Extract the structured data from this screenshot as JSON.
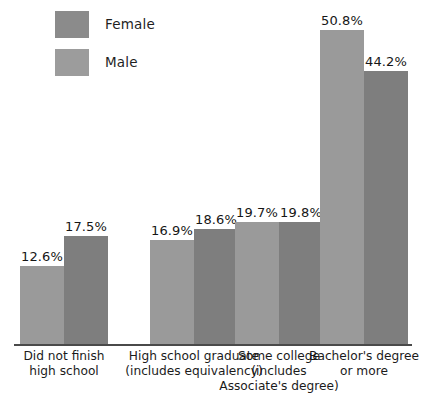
{
  "chart_data": {
    "type": "bar",
    "title": "",
    "subtitle": "",
    "xlabel": "",
    "ylabel": "",
    "ylim": [
      0,
      55
    ],
    "grid": false,
    "legend_position": "top-left",
    "orientation": "vertical",
    "value_suffix": "%",
    "categories": [
      "Did not finish high school",
      "High school graduate (includes equivalency)",
      "Some college (includes Associate's degree)",
      "Bachelor's degree or more"
    ],
    "category_lines": [
      [
        "Did not finish",
        "high school"
      ],
      [
        "High school graduate",
        "(includes equivalency)"
      ],
      [
        "Some college",
        "(includes",
        "Associate's degree)"
      ],
      [
        "Bachelor's degree",
        "or more"
      ]
    ],
    "series": [
      {
        "name": "Female",
        "color": "#9a9a9a",
        "values": [
          12.6,
          16.9,
          19.7,
          50.8
        ],
        "labels": [
          "12.6%",
          "16.9%",
          "19.7%",
          "50.8%"
        ]
      },
      {
        "name": "Male",
        "color": "#7e7e7e",
        "values": [
          17.5,
          18.6,
          19.8,
          44.2
        ],
        "labels": [
          "17.5%",
          "18.6%",
          "19.8%",
          "44.2%"
        ]
      }
    ]
  },
  "legend": {
    "items": [
      {
        "label": "Female",
        "color": "#8b8b8b"
      },
      {
        "label": "Male",
        "color": "#9c9c9c"
      }
    ]
  },
  "axis": {
    "baseline_color": "#4a4a4a"
  }
}
